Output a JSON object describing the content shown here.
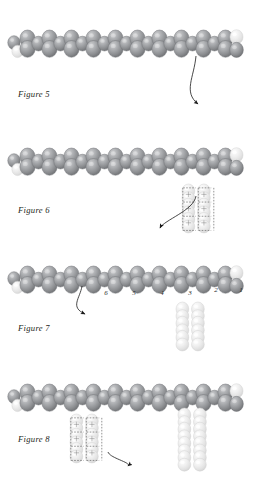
{
  "document": {
    "type": "beading-instruction-diagram",
    "background_color": "#ffffff",
    "width": 267,
    "height": 492
  },
  "palette": {
    "bead_dark_light": "#b9babc",
    "bead_dark_mid": "#8e9093",
    "bead_dark_shadow": "#6e7073",
    "bead_dark_outline": "#74767a",
    "bead_pale_light": "#f4f4f4",
    "bead_pale_mid": "#e2e2e2",
    "bead_pale_shadow": "#cfcfcf",
    "bead_pale_outline": "#d5d5d5",
    "thread_color": "#5b5b5b",
    "arrow_color": "#1a1a1a",
    "caption_color": "#231f20"
  },
  "figures": [
    {
      "id": "figure-5",
      "caption": "Figure 5",
      "caption_x": 18,
      "caption_y": 96,
      "strip": {
        "start_x": 20,
        "top_y": 30,
        "units": 10,
        "pitch": 22,
        "description": "horizontal zigzag strip of ladder-stitch beads"
      },
      "pale_beads": [
        "left-end-lower",
        "right-end-upper"
      ],
      "arrows": [
        {
          "name": "thread-path-arrow",
          "from_x": 196,
          "from_y": 56,
          "to_x": 198,
          "to_y": 104,
          "curve": "down-left-swoop"
        }
      ],
      "hanging_columns": [],
      "numbered_beads": []
    },
    {
      "id": "figure-6",
      "caption": "Figure 6",
      "caption_x": 18,
      "caption_y": 212,
      "strip": {
        "start_x": 20,
        "top_y": 148,
        "units": 10,
        "pitch": 22
      },
      "pale_beads": [
        "left-end-lower",
        "right-end-upper"
      ],
      "arrows": [
        {
          "name": "thread-path-arrow",
          "from_x": 196,
          "from_y": 196,
          "to_x": 160,
          "to_y": 228,
          "curve": "down-left-swoop"
        }
      ],
      "hanging_columns": [
        {
          "name": "ladder-column-threaded",
          "x": 182,
          "y": 184,
          "columns": 2,
          "rows": 3,
          "threaded": true
        }
      ],
      "numbered_beads": []
    },
    {
      "id": "figure-7",
      "caption": "Figure 7",
      "caption_x": 18,
      "caption_y": 330,
      "strip": {
        "start_x": 20,
        "top_y": 266,
        "units": 10,
        "pitch": 22
      },
      "pale_beads": [
        "left-end-lower",
        "right-end-upper"
      ],
      "arrows": [
        {
          "name": "thread-path-arrow",
          "from_x": 82,
          "from_y": 286,
          "to_x": 85,
          "to_y": 314,
          "curve": "down-left-swoop"
        }
      ],
      "hanging_columns": [
        {
          "name": "ladder-column-pale",
          "x": 176,
          "y": 302,
          "columns": 2,
          "rows": 3,
          "threaded": false
        }
      ],
      "numbered_beads": [
        {
          "label": "6",
          "x": 106,
          "y": 295
        },
        {
          "label": "5",
          "x": 134,
          "y": 295
        },
        {
          "label": "4",
          "x": 162,
          "y": 295
        },
        {
          "label": "3",
          "x": 190,
          "y": 295
        },
        {
          "label": "2",
          "x": 216,
          "y": 292
        },
        {
          "label": "1",
          "x": 241,
          "y": 292
        }
      ]
    },
    {
      "id": "figure-8",
      "caption": "Figure 8",
      "caption_x": 18,
      "caption_y": 441,
      "strip": {
        "start_x": 20,
        "top_y": 384,
        "units": 10,
        "pitch": 22
      },
      "pale_beads": [
        "left-end-lower",
        "right-end-upper"
      ],
      "arrows": [
        {
          "name": "thread-path-arrow",
          "from_x": 108,
          "from_y": 452,
          "to_x": 128,
          "to_y": 466,
          "curve": "down-right-swoop"
        }
      ],
      "hanging_columns": [
        {
          "name": "ladder-column-threaded",
          "x": 70,
          "y": 414,
          "columns": 2,
          "rows": 3,
          "threaded": true
        },
        {
          "name": "ladder-column-pale",
          "x": 178,
          "y": 408,
          "columns": 2,
          "rows": 4,
          "threaded": false
        }
      ],
      "numbered_beads": []
    }
  ]
}
